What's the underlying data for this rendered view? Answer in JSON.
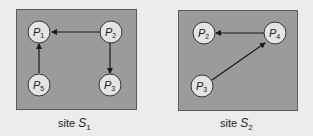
{
  "sites": [
    {
      "name": "site",
      "symbol": "S",
      "subscript": "1",
      "nodes": [
        {
          "id": "P1",
          "letter": "P",
          "sub": "1"
        },
        {
          "id": "P2",
          "letter": "P",
          "sub": "2"
        },
        {
          "id": "P5",
          "letter": "P",
          "sub": "5"
        },
        {
          "id": "P3",
          "letter": "P",
          "sub": "3"
        }
      ],
      "edges": [
        {
          "from": "P2",
          "to": "P1"
        },
        {
          "from": "P2",
          "to": "P3"
        },
        {
          "from": "P5",
          "to": "P1"
        }
      ]
    },
    {
      "name": "site",
      "symbol": "S",
      "subscript": "2",
      "nodes": [
        {
          "id": "P2",
          "letter": "P",
          "sub": "2"
        },
        {
          "id": "P4",
          "letter": "P",
          "sub": "4"
        },
        {
          "id": "P3",
          "letter": "P",
          "sub": "3"
        }
      ],
      "edges": [
        {
          "from": "P4",
          "to": "P2"
        },
        {
          "from": "P3",
          "to": "P4"
        }
      ]
    }
  ],
  "colors": {
    "background": "#ececec",
    "site_fill": "#9b9b9b",
    "node_fill": "#e4e4e4",
    "stroke": "#1a1a1a"
  }
}
